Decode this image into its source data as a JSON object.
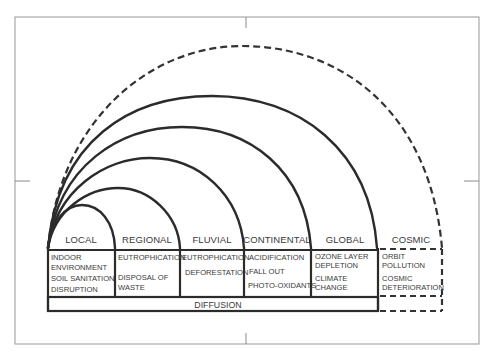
{
  "diagram": {
    "type": "nested-arc scale diagram of environmental problems",
    "zones": [
      {
        "label": "LOCAL",
        "style": "solid",
        "items": [
          "INDOOR",
          "ENVIRONMENT",
          "SOIL SANITATION",
          "DISRUPTION"
        ]
      },
      {
        "label": "REGIONAL",
        "style": "solid",
        "items": [
          "EUTROPHICATION",
          "DISPOSAL OF",
          "WASTE"
        ]
      },
      {
        "label": "FLUVIAL",
        "style": "solid",
        "items": [
          "EUTROPHICATION",
          "DEFORESTATION"
        ]
      },
      {
        "label": "CONTINENTAL",
        "style": "solid",
        "items": [
          "ACIDIFICATION",
          "FALL OUT",
          "PHOTO-OXIDANTS"
        ]
      },
      {
        "label": "GLOBAL",
        "style": "solid",
        "items": [
          "OZONE LAYER",
          "DEPLETION",
          "CLIMATE",
          "CHANGE"
        ]
      },
      {
        "label": "COSMIC",
        "style": "dashed",
        "items": [
          "ORBIT",
          "POLLUTION",
          "COSMIC",
          "DETERIORATION"
        ]
      }
    ],
    "base_band": {
      "label": "DIFFUSION"
    },
    "colors": {
      "line": "#2b2b2b",
      "text": "#3a3a3a",
      "frame": "#a9a9a9",
      "background": "#ffffff"
    }
  }
}
